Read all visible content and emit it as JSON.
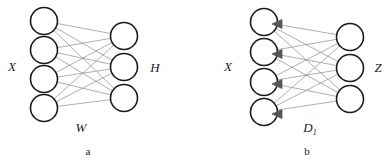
{
  "figure": {
    "type": "neural-network-diagram",
    "background_color": "#ffffff",
    "node_stroke_color": "#1a1a1a",
    "node_fill_color": "#ffffff",
    "node_stroke_width": 1.6,
    "edge_color": "#8c8c8c",
    "edge_width": 0.7,
    "arrow_color": "#555555",
    "label_color": "#1a1a1a"
  },
  "panels": [
    {
      "id": "a",
      "caption": "a",
      "caption_pos": {
        "x": 88,
        "y": 155
      },
      "input_label": {
        "text": "X",
        "x": 12,
        "y": 71
      },
      "output_label": {
        "text": "H",
        "x": 155,
        "y": 72
      },
      "weight_label": {
        "text": "W",
        "x": 81,
        "y": 132
      },
      "weight_subscript": "",
      "has_arrows": false,
      "input_nodes": [
        {
          "cx": 44,
          "cy": 21,
          "r": 13.5
        },
        {
          "cx": 44,
          "cy": 50,
          "r": 13.5
        },
        {
          "cx": 44,
          "cy": 79,
          "r": 13.5
        },
        {
          "cx": 44,
          "cy": 108,
          "r": 13.5
        }
      ],
      "output_nodes": [
        {
          "cx": 124,
          "cy": 36,
          "r": 13.5
        },
        {
          "cx": 124,
          "cy": 67,
          "r": 13.5
        },
        {
          "cx": 124,
          "cy": 98,
          "r": 13.5
        }
      ],
      "edge_count": 12
    },
    {
      "id": "b",
      "caption": "b",
      "caption_pos": {
        "x": 307,
        "y": 155
      },
      "input_label": {
        "text": "X",
        "x": 228,
        "y": 71
      },
      "output_label": {
        "text": "Z",
        "x": 378,
        "y": 72
      },
      "weight_label": {
        "text": "D",
        "x": 310,
        "y": 132
      },
      "weight_subscript": "1",
      "has_arrows": true,
      "input_nodes": [
        {
          "cx": 264,
          "cy": 22,
          "r": 13.5
        },
        {
          "cx": 264,
          "cy": 52,
          "r": 13.5
        },
        {
          "cx": 264,
          "cy": 82,
          "r": 13.5
        },
        {
          "cx": 264,
          "cy": 112,
          "r": 13.5
        }
      ],
      "output_nodes": [
        {
          "cx": 350,
          "cy": 37,
          "r": 13.5
        },
        {
          "cx": 350,
          "cy": 68,
          "r": 13.5
        },
        {
          "cx": 350,
          "cy": 99,
          "r": 13.5
        }
      ],
      "arrowheads": [
        {
          "x": 281,
          "y": 24
        },
        {
          "x": 281,
          "y": 54
        },
        {
          "x": 281,
          "y": 84
        },
        {
          "x": 281,
          "y": 114
        }
      ],
      "edge_count": 12
    }
  ]
}
